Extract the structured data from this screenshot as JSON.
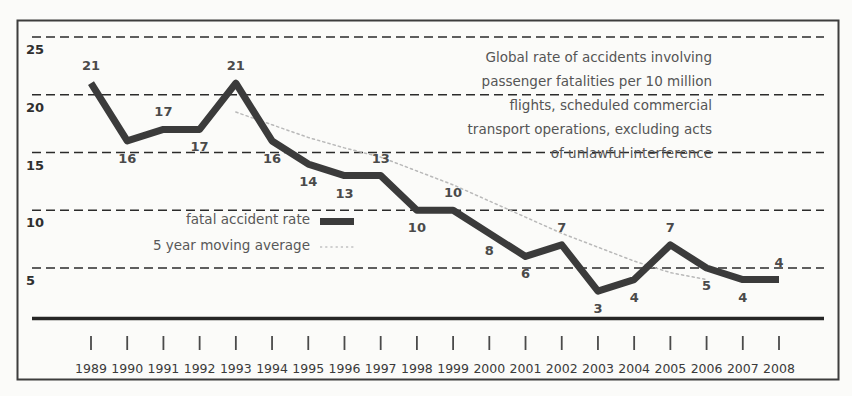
{
  "chart_data": {
    "type": "line",
    "title": "",
    "caption_lines": [
      "Global rate of accidents involving",
      "passenger fatalities per 10 million",
      "flights, scheduled commercial",
      "transport operations, excluding acts",
      "of unlawful interference"
    ],
    "xlabel": "",
    "ylabel": "",
    "categories": [
      "1989",
      "1990",
      "1991",
      "1992",
      "1993",
      "1994",
      "1995",
      "1996",
      "1997",
      "1998",
      "1999",
      "2000",
      "2001",
      "2002",
      "2003",
      "2004",
      "2005",
      "2006",
      "2007",
      "2008"
    ],
    "ytick_labels": [
      "25",
      "20",
      "15",
      "10",
      "5"
    ],
    "ytick_values": [
      25,
      20,
      15,
      10,
      5
    ],
    "ylim": [
      0,
      27
    ],
    "grid": "horizontal-dashed",
    "legend_position": "inside-left",
    "series": [
      {
        "name": "fatal accident rate",
        "style": "thick-solid",
        "color": "#3b3b3b",
        "values": [
          21,
          16,
          17,
          17,
          21,
          16,
          14,
          13,
          13,
          10,
          10,
          8,
          6,
          7,
          3,
          4,
          7,
          5,
          4,
          4
        ],
        "data_labels": [
          "21",
          "16",
          "17",
          "17",
          "21",
          "16",
          "14",
          "13",
          "13",
          "10",
          "10",
          "8",
          "6",
          "7",
          "3",
          "4",
          "7",
          "5",
          "4",
          "4"
        ]
      },
      {
        "name": "5 year moving average",
        "style": "thin-dotted",
        "color": "#b9b9b9",
        "x": [
          "1993",
          "1994",
          "1995",
          "1996",
          "1997",
          "1998",
          "1999",
          "2000",
          "2001",
          "2002",
          "2003",
          "2004",
          "2005",
          "2006"
        ],
        "values": [
          18.5,
          17.4,
          16.3,
          15.4,
          14.6,
          13.4,
          12.2,
          10.8,
          9.4,
          8.0,
          6.8,
          5.6,
          4.6,
          4.0
        ]
      }
    ]
  },
  "legend": {
    "items": [
      {
        "label": "fatal accident rate",
        "marker": "thick-bar",
        "color": "#3b3b3b"
      },
      {
        "label": "5 year moving average",
        "marker": "dotted-line",
        "color": "#b9b9b9"
      }
    ]
  },
  "colors": {
    "background": "#fbfbf9",
    "border": "#3d3d3d",
    "axis_rule": "#262626",
    "gridline": "#2b2b2b",
    "series_primary": "#3b3b3b",
    "series_secondary": "#b9b9b9",
    "label_text": "#4a4a4a",
    "caption_text": "#555555"
  }
}
